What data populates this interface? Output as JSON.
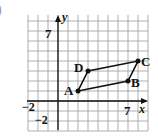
{
  "figure": {
    "partial_label": ")",
    "grid": {
      "xmin": -3,
      "xmax": 9,
      "ymin": -3,
      "ymax": 8,
      "step": 1
    },
    "axes": {
      "x_label": "x",
      "y_label": "y"
    },
    "ticks": {
      "y_top": "7",
      "x_right": "7",
      "x_left": "−2",
      "y_bottom": "−2"
    },
    "points": [
      {
        "name": "A",
        "x": 2,
        "y": 1
      },
      {
        "name": "B",
        "x": 7,
        "y": 2
      },
      {
        "name": "C",
        "x": 8,
        "y": 4
      },
      {
        "name": "D",
        "x": 3,
        "y": 3
      }
    ],
    "shape": "parallelogram ABCD",
    "colors": {
      "grid": "#9a9a9a",
      "ink": "#111111"
    }
  }
}
